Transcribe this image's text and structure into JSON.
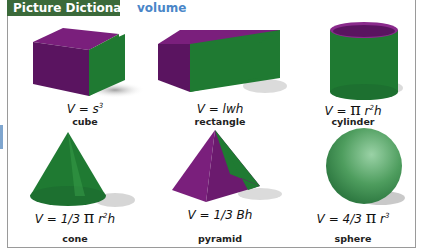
{
  "header": {
    "tab_label": "Picture Dictionary",
    "topic": "volume"
  },
  "colors": {
    "tab_bg": "#3b6a3a",
    "topic": "#4a86c8",
    "purple": "#6b1a6e",
    "green": "#1f7a32"
  },
  "items": [
    {
      "name": "cube",
      "formula_pre": "V = s",
      "sup": "3",
      "formula_post": ""
    },
    {
      "name": "rectangle",
      "formula_pre": "V = lwh",
      "sup": "",
      "formula_post": ""
    },
    {
      "name": "cylinder",
      "formula_pre": "V = ",
      "pi": "π",
      "formula_mid": " r",
      "sup": "2",
      "formula_post": "h"
    },
    {
      "name": "cone",
      "formula_pre": "V = 1/3 ",
      "pi": "π",
      "formula_mid": " r",
      "sup": "2",
      "formula_post": "h"
    },
    {
      "name": "pyramid",
      "formula_pre": "V = 1/3 Bh",
      "sup": "",
      "formula_post": ""
    },
    {
      "name": "sphere",
      "formula_pre": "V = 4/3 ",
      "pi": "π",
      "formula_mid": " r",
      "sup": "3",
      "formula_post": ""
    }
  ]
}
